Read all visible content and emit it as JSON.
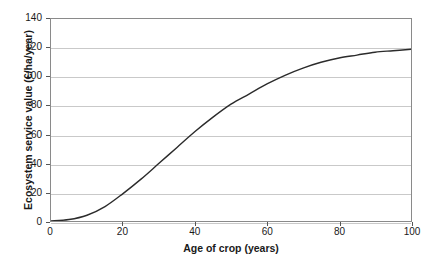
{
  "chart_data": {
    "type": "line",
    "title": "",
    "xlabel": "Age of crop (years)",
    "ylabel": "Ecosystem service value (€/ha/year)",
    "xlim": [
      0,
      100
    ],
    "ylim": [
      0,
      140
    ],
    "xticks": [
      0,
      20,
      40,
      60,
      80,
      100
    ],
    "yticks": [
      0,
      20,
      40,
      60,
      80,
      100,
      120,
      140
    ],
    "xtick_labels": [
      "0",
      "20",
      "40",
      "60",
      "80",
      "100"
    ],
    "ytick_labels": [
      "0",
      "20",
      "40",
      "60",
      "80",
      "100",
      "120",
      "140"
    ],
    "grid": "horizontal",
    "legend": "none",
    "series": [
      {
        "name": "Ecosystem service value",
        "color": "#2b2b2b",
        "x": [
          0,
          5,
          10,
          15,
          20,
          25,
          30,
          35,
          40,
          45,
          50,
          55,
          60,
          65,
          70,
          75,
          80,
          85,
          90,
          95,
          100
        ],
        "values": [
          0,
          1,
          4,
          10,
          19,
          29,
          40,
          51,
          62,
          72,
          81,
          88,
          95,
          101,
          106,
          110,
          113,
          115,
          117,
          118,
          119
        ]
      }
    ]
  },
  "axes": {
    "x_title": "Age of crop (years)",
    "y_title": "Ecosystem service value (€/ha/year)"
  }
}
